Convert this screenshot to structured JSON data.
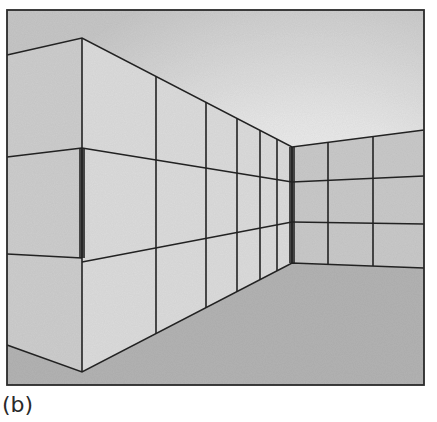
{
  "figure": {
    "caption": "(b)",
    "colors": {
      "ceiling_light": "#f6f6f6",
      "ceiling_dark": "#c9c9c9",
      "wall_near_left": "#cfcfcf",
      "wall_left": "#dddddd",
      "wall_right": "#cbcbcb",
      "floor": "#b4b4b4",
      "line": "#222222",
      "corner_shadow": "#444444"
    }
  }
}
